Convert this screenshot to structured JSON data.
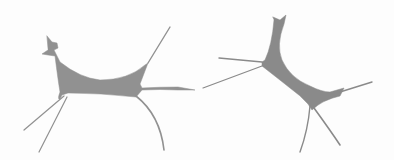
{
  "image": {
    "width": 394,
    "height": 160,
    "background": "#fdfdfd",
    "fill_color": "#8f8f8f",
    "objects": [
      {
        "name": "left-cell-shape"
      },
      {
        "name": "right-cell-shape"
      }
    ]
  }
}
